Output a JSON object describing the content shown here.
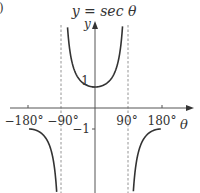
{
  "title": "y = sec θ",
  "panel_marker": ")",
  "chart_data": {
    "type": "line",
    "title": "y = sec θ",
    "xlabel": "θ",
    "ylabel": "y",
    "x_ticks": [
      "−180°",
      "−90°",
      "90°",
      "180°"
    ],
    "y_ticks": [
      "1",
      "−1"
    ],
    "asymptotes_x": [
      -90,
      90
    ],
    "xlim": [
      -200,
      200
    ],
    "ylim": [
      -4,
      4.5
    ],
    "grid": false,
    "series": [
      {
        "name": "sec θ",
        "function": "1/cos(θ)",
        "domain": [
          -180,
          180
        ]
      }
    ]
  },
  "labels": {
    "x_axis": "θ",
    "y_axis": "y",
    "tick_neg180": "−180°",
    "tick_neg90": "−90°",
    "tick_90": "90°",
    "tick_180": "180°",
    "y_one": "1",
    "y_neg_one": "−1"
  }
}
